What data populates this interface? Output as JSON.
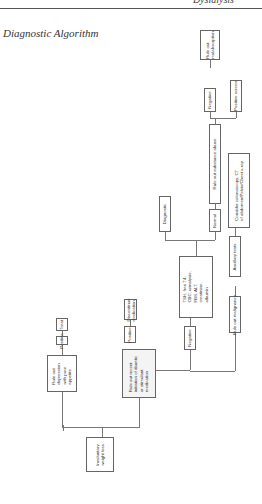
{
  "header": {
    "running_head": "Dyslalysis",
    "section_title": "Diagnostic Algorithm"
  },
  "diagram": {
    "orientation": "rotated 90° counter-clockwise; flow proceeds upward",
    "nodes": {
      "root": "Involuntary\nweight loss",
      "depression": "Rule out\ndepression\nwith poor\nappetite",
      "dep_positive": "Positive",
      "treat": "Treat",
      "diuretic": "Rule out recent\ninitiation of diuretic\nor stimulant\nmedication",
      "diu_positive": "Positive",
      "discontinue": "Discontinue\nmedication",
      "diu_negative": "Negative",
      "labs": "TSH, free T4,\nCBC, urinalysis,\nFBS, ALT,\ncreatinine,\nalbumin",
      "diagnostic": "Diagnostic",
      "normal": "Normal",
      "substance": "Rule out substance abuse",
      "sub_negative": "Negative",
      "malabsorption": "Rule out\nmalabsorption",
      "positive_screen": "Positive screen",
      "malignancy": "Rule out malignancy",
      "ancillary": "Ancillary tests",
      "consider": "Consider colonoscopy, CT\nof abdomen/Pelvis/Chest x-ray"
    }
  }
}
